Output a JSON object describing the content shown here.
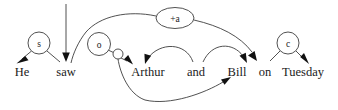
{
  "diagram": {
    "title": "He saw Arthur and Bill on Tuesday",
    "background_color": "#ffffff",
    "stroke_color": "#3d3d3d",
    "arrow_color": "#111111",
    "text_color": "#1a1a1a",
    "sentence": [
      "He",
      "saw",
      "Arthur",
      "and",
      "Bill",
      "on",
      "Tuesday"
    ],
    "words": [
      {
        "id": "w-he",
        "label": "He",
        "x": 22,
        "y": 72
      },
      {
        "id": "w-saw",
        "label": "saw",
        "x": 66,
        "y": 72
      },
      {
        "id": "w-arthur",
        "label": "Arthur",
        "x": 148,
        "y": 72
      },
      {
        "id": "w-and",
        "label": "and",
        "x": 196,
        "y": 72
      },
      {
        "id": "w-bill",
        "label": "Bill",
        "x": 237,
        "y": 72
      },
      {
        "id": "w-on",
        "label": "on",
        "x": 265,
        "y": 72
      },
      {
        "id": "w-tuesday",
        "label": "Tuesday",
        "x": 303,
        "y": 72
      }
    ],
    "nodes": [
      {
        "id": "n-s",
        "label": "s",
        "shape": "circle",
        "cx": 39,
        "cy": 43,
        "r": 11
      },
      {
        "id": "n-o",
        "label": "o",
        "shape": "circle",
        "cx": 99,
        "cy": 44,
        "r": 11.5
      },
      {
        "id": "n-plus-a",
        "label": "+a",
        "shape": "ellipse",
        "cx": 175,
        "cy": 18,
        "rx": 19,
        "ry": 10.5
      },
      {
        "id": "n-c",
        "label": "c",
        "shape": "circle",
        "cx": 288,
        "cy": 43,
        "r": 11
      },
      {
        "id": "n-junction",
        "label": "",
        "shape": "circle",
        "cx": 118,
        "cy": 54,
        "r": 5
      }
    ],
    "edges": [
      {
        "id": "e-s-he",
        "from": "n-s",
        "to": "w-he",
        "arrow": true
      },
      {
        "id": "e-s-saw",
        "from": "n-s",
        "to": "w-saw",
        "arrow": false
      },
      {
        "id": "e-top-saw",
        "from": "top",
        "to": "w-saw",
        "arrow": true
      },
      {
        "id": "e-plusa-saw",
        "from": "n-plus-a",
        "to": "w-saw",
        "arrow": false
      },
      {
        "id": "e-plusa-on",
        "from": "n-plus-a",
        "to": "w-on",
        "arrow": true
      },
      {
        "id": "e-o-junction",
        "from": "n-o",
        "to": "n-junction",
        "arrow": false
      },
      {
        "id": "e-junc-arthur",
        "from": "n-junction",
        "to": "w-arthur",
        "arrow": true
      },
      {
        "id": "e-junc-bill",
        "from": "n-junction",
        "to": "w-bill",
        "arrow": true
      },
      {
        "id": "e-and-arthur",
        "from": "w-and",
        "to": "w-arthur",
        "arrow": true
      },
      {
        "id": "e-and-bill",
        "from": "w-and",
        "to": "w-bill",
        "arrow": true
      },
      {
        "id": "e-c-on",
        "from": "n-c",
        "to": "w-on",
        "arrow": false
      },
      {
        "id": "e-c-tuesday",
        "from": "n-c",
        "to": "w-tuesday",
        "arrow": true
      }
    ]
  }
}
